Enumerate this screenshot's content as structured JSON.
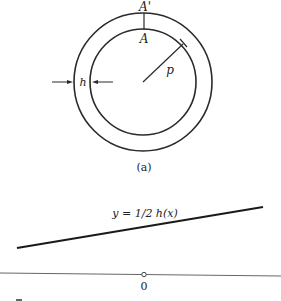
{
  "figure": {
    "ring": {
      "outer_label": "A'",
      "inner_label": "A",
      "thickness_label": "h",
      "radius_label": "p"
    },
    "caption": "(a)",
    "graph": {
      "curve_label": "y = 1/2 h(x)",
      "origin_label": "0"
    }
  },
  "colors": {
    "stroke": "#2a2a2a",
    "axis": "#666666",
    "background": "#ffffff"
  }
}
